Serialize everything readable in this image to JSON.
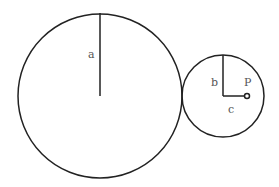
{
  "diagram": {
    "labels": {
      "a": "a",
      "b": "b",
      "c": "c",
      "p": "P"
    },
    "stroke_color": "#222222",
    "label_color": "#555555"
  }
}
